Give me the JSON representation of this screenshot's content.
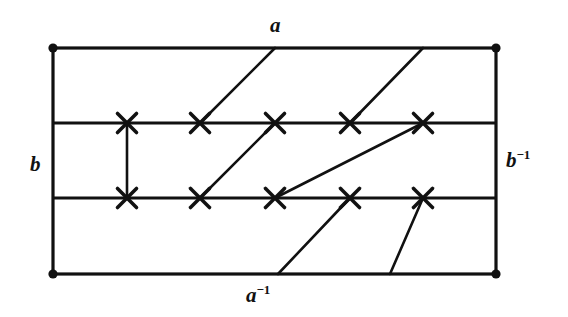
{
  "figure": {
    "name": "fundamental-polygon-torus-diagram",
    "background_color": "#ffffff",
    "stroke_color": "#111111",
    "width": 568,
    "height": 317,
    "labels": {
      "top": {
        "base": "a",
        "sup": ""
      },
      "bottom": {
        "base": "a",
        "sup": "−1"
      },
      "left": {
        "base": "b",
        "sup": ""
      },
      "right": {
        "base": "b",
        "sup": "−1"
      }
    },
    "rectangle": {
      "left": 53,
      "right": 496,
      "top": 48,
      "bottom": 274,
      "stroke_width": 3.2
    },
    "horizontal_bands": [
      123,
      198
    ],
    "corner_dots": [
      {
        "x": 53,
        "y": 48,
        "r": 4.6
      },
      {
        "x": 496,
        "y": 48,
        "r": 4.6
      },
      {
        "x": 53,
        "y": 274,
        "r": 4.6
      },
      {
        "x": 496,
        "y": 274,
        "r": 4.6
      }
    ],
    "cross_marks": [
      {
        "x": 127,
        "y": 123
      },
      {
        "x": 200,
        "y": 123
      },
      {
        "x": 275,
        "y": 123
      },
      {
        "x": 350,
        "y": 123
      },
      {
        "x": 423,
        "y": 123
      },
      {
        "x": 127,
        "y": 198
      },
      {
        "x": 200,
        "y": 198
      },
      {
        "x": 275,
        "y": 198
      },
      {
        "x": 350,
        "y": 198
      },
      {
        "x": 423,
        "y": 198
      }
    ],
    "cross_arm": 9.5,
    "segments": [
      {
        "name": "vertical-connector",
        "x1": 127,
        "y1": 123,
        "x2": 127,
        "y2": 198
      },
      {
        "name": "top-band-diagonal-1",
        "x1": 275,
        "y1": 48,
        "x2": 200,
        "y2": 123
      },
      {
        "name": "top-band-diagonal-2",
        "x1": 423,
        "y1": 48,
        "x2": 350,
        "y2": 123
      },
      {
        "name": "middle-band-diagonal-steep",
        "x1": 275,
        "y1": 123,
        "x2": 200,
        "y2": 198
      },
      {
        "name": "middle-band-diagonal-shallow",
        "x1": 423,
        "y1": 123,
        "x2": 275,
        "y2": 198
      },
      {
        "name": "bottom-band-diagonal-1",
        "x1": 350,
        "y1": 198,
        "x2": 278,
        "y2": 274
      },
      {
        "name": "bottom-band-diagonal-2",
        "x1": 423,
        "y1": 198,
        "x2": 390,
        "y2": 274
      }
    ]
  }
}
